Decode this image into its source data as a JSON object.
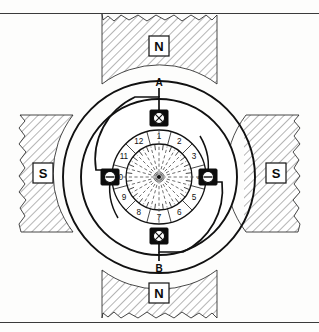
{
  "figure": {
    "type": "schematic-diagram"
  },
  "poles": [
    {
      "id": "pole-top",
      "label": "N",
      "position": "top"
    },
    {
      "id": "pole-right",
      "label": "S",
      "position": "right"
    },
    {
      "id": "pole-bottom",
      "label": "N",
      "position": "bottom"
    },
    {
      "id": "pole-left",
      "label": "S",
      "position": "left"
    }
  ],
  "terminals": [
    {
      "id": "terminal-a",
      "label": "A",
      "position": "top"
    },
    {
      "id": "terminal-b",
      "label": "B",
      "position": "bottom"
    }
  ],
  "brushes": [
    {
      "id": "brush-top",
      "position": "top",
      "current_symbol": "cross",
      "meaning": "current into page"
    },
    {
      "id": "brush-right",
      "position": "right",
      "current_symbol": "dot-bar",
      "meaning": "current out of page"
    },
    {
      "id": "brush-bottom",
      "position": "bottom",
      "current_symbol": "cross",
      "meaning": "current into page"
    },
    {
      "id": "brush-left",
      "position": "left",
      "current_symbol": "dot-bar",
      "meaning": "current out of page"
    }
  ],
  "commutator": {
    "segment_count": 12,
    "segment_labels": [
      "1",
      "2",
      "3",
      "4",
      "5",
      "6",
      "7",
      "8",
      "9",
      "10",
      "11",
      "12"
    ],
    "start_angle_deg": -90,
    "direction": "clockwise"
  },
  "colors": {
    "ink": "#111111",
    "frame": "#3b3b3b",
    "hatch": "#6b6b6b",
    "paper": "#fdfdfc",
    "dash": "#4a4a4a"
  },
  "geometry": {
    "center_x": 159,
    "center_y": 177,
    "outer_radius": 96,
    "yoke_radius": 78,
    "armature_outer_radius": 62,
    "commutator_outer_radius": 47,
    "commutator_inner_radius": 33,
    "hub_radius": 2
  }
}
